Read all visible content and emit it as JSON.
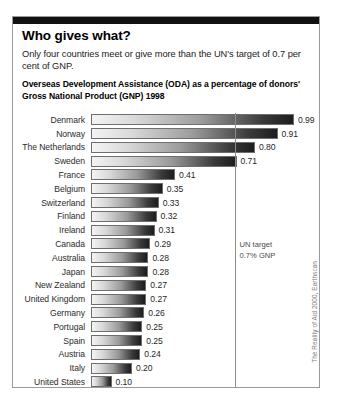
{
  "panel": {
    "title": "Who gives what?",
    "subtitle": "Only four countries meet or give more than the UN's target of 0.7 per cent of GNP.",
    "section_heading": "Overseas Development Assistance (ODA) as a percentage of donors' Gross National Product (GNP) 1998",
    "credit": "The Reality of Aid 2000, Earthscan"
  },
  "annotation": {
    "target_line_1": "UN target",
    "target_line_2": "0.7% GNP",
    "target_value": 0.7
  },
  "chart_data": {
    "type": "bar",
    "orientation": "horizontal",
    "title": "Overseas Development Assistance (ODA) as a percentage of donors' Gross National Product (GNP) 1998",
    "xlabel": "",
    "ylabel": "",
    "xlim": [
      0,
      1.05
    ],
    "grid": false,
    "legend": "none",
    "tick_labels": [
      "0.5",
      "1.0"
    ],
    "ticks": [
      0.5,
      1.0
    ],
    "categories": [
      "Denmark",
      "Norway",
      "The Netherlands",
      "Sweden",
      "France",
      "Belgium",
      "Switzerland",
      "Finland",
      "Ireland",
      "Canada",
      "Australia",
      "Japan",
      "New Zealand",
      "United Kingdom",
      "Germany",
      "Portugal",
      "Spain",
      "Austria",
      "Italy",
      "United States"
    ],
    "values": [
      0.99,
      0.91,
      0.8,
      0.71,
      0.41,
      0.35,
      0.33,
      0.32,
      0.31,
      0.29,
      0.28,
      0.28,
      0.27,
      0.27,
      0.26,
      0.25,
      0.25,
      0.24,
      0.2,
      0.1
    ],
    "value_labels": [
      "0.99",
      "0.91",
      "0.80",
      "0.71",
      "0.41",
      "0.35",
      "0.33",
      "0.32",
      "0.31",
      "0.29",
      "0.28",
      "0.28",
      "0.27",
      "0.27",
      "0.26",
      "0.25",
      "0.25",
      "0.24",
      "0.20",
      "0.10"
    ],
    "annotations": [
      {
        "type": "vline",
        "value": 0.7,
        "label": "UN target 0.7% GNP"
      }
    ]
  },
  "colors": {
    "bar_light": "#f4f4f4",
    "bar_dark": "#1d1d1d",
    "rule": "#111111",
    "axis": "#8c8c8c"
  }
}
